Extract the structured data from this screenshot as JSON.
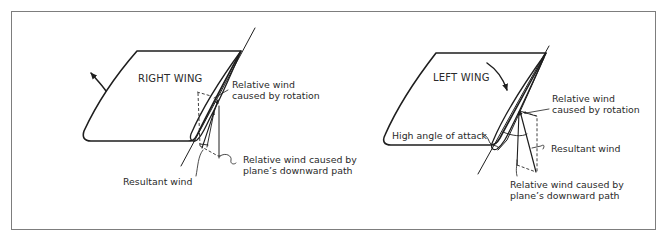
{
  "diagram": {
    "colors": {
      "ink": "#1e1e1e",
      "frame": "#7d7d7d",
      "background": "#ffffff",
      "text": "#2a2a2a"
    },
    "right_panel": {
      "wing_label": "RIGHT WING",
      "rotation_arrow_icon": "curved-arrow-up",
      "callouts": {
        "rotation_wind": [
          "Relative wind",
          "caused by rotation"
        ],
        "downward_wind": [
          "Relative wind caused by",
          "plane’s downward path"
        ],
        "resultant_wind": "Resultant wind"
      }
    },
    "left_panel": {
      "wing_label": "LEFT WING",
      "rotation_arrow_icon": "curved-arrow-down",
      "callouts": {
        "rotation_wind": [
          "Relative wind",
          "caused by rotation"
        ],
        "angle_of_attack": "High angle of attack",
        "resultant_wind": "Resultant wind",
        "downward_wind": [
          "Relative wind caused by",
          "plane’s downward path"
        ]
      }
    }
  }
}
